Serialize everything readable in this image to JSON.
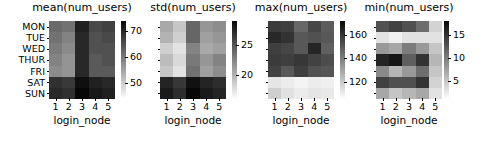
{
  "figure": {
    "width": 479,
    "height": 143,
    "background": "#ffffff",
    "colormap": "gray-reversed",
    "panel_count": 4
  },
  "chart_data": [
    {
      "type": "heatmap",
      "title": "mean(num_users)",
      "xlabel": "login_node",
      "ylabel": "",
      "categories_x": [
        "1",
        "2",
        "3",
        "4",
        "5"
      ],
      "categories_y": [
        "MON",
        "TUE",
        "WED",
        "THUR",
        "FRI",
        "SAT",
        "SUN"
      ],
      "colorbar_ticks": [
        "70",
        "60",
        "50"
      ],
      "colorbar_tick_values": [
        70,
        60,
        50
      ],
      "zlim": [
        44,
        74
      ],
      "values": [
        [
          62,
          61,
          71,
          66,
          67
        ],
        [
          61,
          59,
          70,
          65,
          66
        ],
        [
          60,
          58,
          70,
          65,
          65
        ],
        [
          59,
          57,
          70,
          64,
          65
        ],
        [
          58,
          57,
          70,
          64,
          64
        ],
        [
          69,
          68,
          73,
          71,
          70
        ],
        [
          70,
          69,
          74,
          72,
          71
        ]
      ],
      "grid": false,
      "legend": "colorbar-right"
    },
    {
      "type": "heatmap",
      "title": "std(num_users)",
      "xlabel": "login_node",
      "ylabel": "",
      "categories_x": [
        "1",
        "2",
        "3",
        "4",
        "5"
      ],
      "categories_y": [
        "MON",
        "TUE",
        "WED",
        "THUR",
        "FRI",
        "SAT",
        "SUN"
      ],
      "colorbar_ticks": [
        "25",
        "20"
      ],
      "colorbar_tick_values": [
        25,
        20
      ],
      "zlim": [
        16,
        29
      ],
      "values": [
        [
          20.5,
          19.0,
          24.0,
          21.5,
          22.0
        ],
        [
          20.0,
          18.5,
          24.0,
          21.0,
          21.5
        ],
        [
          18.5,
          17.5,
          22.5,
          20.5,
          21.0
        ],
        [
          19.5,
          18.0,
          23.0,
          21.5,
          22.5
        ],
        [
          19.0,
          17.5,
          23.5,
          21.0,
          22.0
        ],
        [
          27.5,
          26.5,
          28.5,
          27.5,
          27.0
        ],
        [
          28.0,
          27.0,
          29.0,
          28.0,
          27.5
        ]
      ],
      "grid": false,
      "legend": "colorbar-right"
    },
    {
      "type": "heatmap",
      "title": "max(num_users)",
      "xlabel": "login_node",
      "ylabel": "",
      "categories_x": [
        "1",
        "2",
        "3",
        "4",
        "5"
      ],
      "categories_y": [
        "MON",
        "TUE",
        "WED",
        "THUR",
        "FRI",
        "SAT",
        "SUN"
      ],
      "colorbar_ticks": [
        "160",
        "140",
        "120"
      ],
      "colorbar_tick_values": [
        160,
        140,
        120
      ],
      "zlim": [
        105,
        172
      ],
      "values": [
        [
          158,
          157,
          146,
          155,
          149
        ],
        [
          163,
          160,
          150,
          152,
          150
        ],
        [
          157,
          155,
          150,
          164,
          148
        ],
        [
          158,
          157,
          159,
          156,
          153
        ],
        [
          156,
          150,
          157,
          152,
          151
        ],
        [
          112,
          110,
          108,
          110,
          109
        ],
        [
          118,
          113,
          110,
          112,
          111
        ]
      ],
      "grid": false,
      "legend": "colorbar-right"
    },
    {
      "type": "heatmap",
      "title": "min(num_users)",
      "xlabel": "login_node",
      "ylabel": "",
      "categories_x": [
        "1",
        "2",
        "3",
        "4",
        "5"
      ],
      "categories_y": [
        "MON",
        "TUE",
        "WED",
        "THUR",
        "FRI",
        "SAT",
        "SUN"
      ],
      "colorbar_ticks": [
        "15",
        "10",
        "5"
      ],
      "colorbar_tick_values": [
        15,
        10,
        5
      ],
      "zlim": [
        1,
        18
      ],
      "values": [
        [
          13,
          14,
          13,
          11,
          4
        ],
        [
          3,
          2,
          3,
          3,
          3
        ],
        [
          8,
          7,
          10,
          8,
          5
        ],
        [
          16,
          17,
          12,
          15,
          6
        ],
        [
          9,
          6,
          8,
          11,
          5
        ],
        [
          14,
          13,
          13,
          15,
          4
        ],
        [
          7,
          5,
          6,
          7,
          3
        ]
      ],
      "grid": false,
      "legend": "colorbar-right"
    }
  ]
}
